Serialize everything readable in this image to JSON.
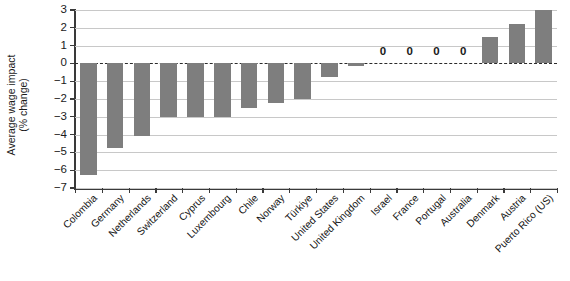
{
  "chart_data": {
    "type": "bar",
    "title": "",
    "subtitle": "",
    "xlabel": "",
    "ylabel": "Average wage impact (% change)",
    "ylabel_line1": "Average wage impact",
    "ylabel_line2": "(% change)",
    "ylim": [
      -7,
      3
    ],
    "yticks": [
      3,
      2,
      1,
      0,
      -1,
      -2,
      -3,
      -4,
      -5,
      -6,
      -7
    ],
    "ytick_labels": [
      "3",
      "2",
      "1",
      "0",
      "−1",
      "−2",
      "−3",
      "−4",
      "−5",
      "−6",
      "−7"
    ],
    "grid": true,
    "grid_axis": "y",
    "legend": "none",
    "zero_line": true,
    "zero_line_style": "dashed",
    "bar_color": "#7e7e7e",
    "categories": [
      "Colombia",
      "Germany",
      "Netherlands",
      "Switzerland",
      "Cyprus",
      "Luxembourg",
      "Chile",
      "Norway",
      "Türkiye",
      "United States",
      "United Kingdom",
      "Israel",
      "France",
      "Portugal",
      "Australia",
      "Denmark",
      "Austria",
      "Puerto Rico (US)"
    ],
    "values": [
      -6.25,
      -4.75,
      -4.1,
      -3.0,
      -3.0,
      -3.0,
      -2.5,
      -2.25,
      -2.0,
      -0.75,
      -0.15,
      0,
      0,
      0,
      0,
      1.5,
      2.2,
      3.0
    ],
    "data_labels": {
      "Israel": "0",
      "France": "0",
      "Portugal": "0",
      "Australia": "0"
    }
  }
}
